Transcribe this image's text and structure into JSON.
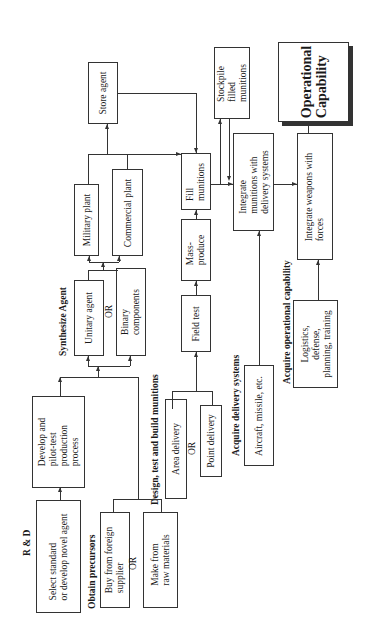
{
  "diagram": {
    "orientation": "rotated-90-ccw",
    "groups": {
      "rnd": "R & D",
      "precursors": "Obtain precursors",
      "synthesize": "Synthesize Agent",
      "design": "Design, test and build munitions",
      "delivery": "Acquire delivery systems",
      "operational": "Acquire operational capability"
    },
    "nodes": {
      "select_agent": "Select standard\nor develop novel agent",
      "develop_process": "Develop and\npilot-test\nproduction\nprocess",
      "buy_foreign": "Buy from foreign\nsupplier",
      "make_raw": "Make from\nraw materials",
      "unitary": "Unitary agent",
      "binary": "Binary\ncomponents",
      "military_plant": "Military plant",
      "commercial_plant": "Commercial plant",
      "store_agent": "Store agent",
      "area_delivery": "Area delivery",
      "point_delivery": "Point delivery",
      "field_test": "Field test",
      "mass_produce": "Mass-\nproduce",
      "fill_munitions": "Fill\nmunitions",
      "stockpile": "Stockpile\nfilled\nmunitions",
      "integrate_munitions": "Integrate\nmunitions with\ndelivery systems",
      "aircraft": "Aircraft, missile, etc.",
      "logistics": "Logistics,\ndefense,\nplanning, training",
      "integrate_weapons": "Integrate weapons with\nforces",
      "operational_capability": "Operational\nCapability"
    },
    "or_labels": {
      "precursors_or": "OR",
      "synth_or": "OR",
      "delivery_or": "OR"
    },
    "edges": [
      [
        "select_agent",
        "develop_process"
      ],
      [
        "develop_process",
        "unitary"
      ],
      [
        "develop_process",
        "binary"
      ],
      [
        "buy_foreign",
        "unitary"
      ],
      [
        "make_raw",
        "binary"
      ],
      [
        "unitary",
        "military_plant"
      ],
      [
        "binary",
        "commercial_plant"
      ],
      [
        "military_plant",
        "store_agent"
      ],
      [
        "commercial_plant",
        "fill_munitions"
      ],
      [
        "store_agent",
        "fill_munitions"
      ],
      [
        "area_delivery",
        "field_test"
      ],
      [
        "point_delivery",
        "field_test"
      ],
      [
        "field_test",
        "mass_produce"
      ],
      [
        "mass_produce",
        "fill_munitions"
      ],
      [
        "fill_munitions",
        "stockpile"
      ],
      [
        "stockpile",
        "integrate_munitions"
      ],
      [
        "fill_munitions",
        "integrate_munitions"
      ],
      [
        "aircraft",
        "integrate_munitions"
      ],
      [
        "integrate_munitions",
        "integrate_weapons"
      ],
      [
        "logistics",
        "integrate_weapons"
      ],
      [
        "integrate_weapons",
        "operational_capability"
      ]
    ]
  }
}
